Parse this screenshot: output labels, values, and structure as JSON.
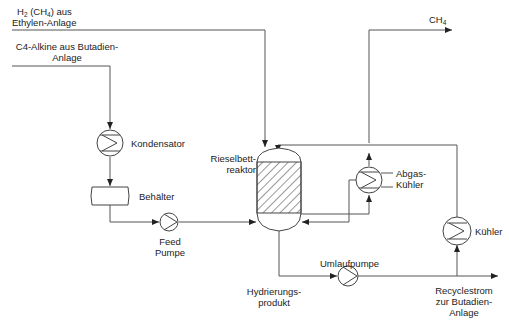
{
  "diagram": {
    "type": "process-flow",
    "streams": {
      "h2_feed": {
        "line1_parts": [
          "H",
          "2",
          " (CH",
          "4",
          ") aus"
        ],
        "line2": "Ethylen-Anlage"
      },
      "c4_feed": {
        "line1": "C4-Alkine aus Butadien-",
        "line2": "Anlage"
      },
      "ch4_out": {
        "parts": [
          "CH",
          "4"
        ]
      },
      "product": {
        "line1": "Hydrierungs-",
        "line2": "produkt"
      },
      "recycle": {
        "line1": "Recyclestrom",
        "line2": "zur Butadien-",
        "line3": "Anlage"
      }
    },
    "equipment": {
      "condenser": "Kondensator",
      "vessel": "Behälter",
      "feed_pump": {
        "line1": "Feed",
        "line2": "Pumpe"
      },
      "reactor": {
        "line1": "Rieselbett-",
        "line2": "reaktor"
      },
      "offgas_cooler": {
        "line1": "Abgas-",
        "line2": "Kühler"
      },
      "circulation_pump": "Umlaufpumpe",
      "cooler": "Kühler"
    },
    "colors": {
      "line": "#555555",
      "background": "#ffffff"
    }
  }
}
